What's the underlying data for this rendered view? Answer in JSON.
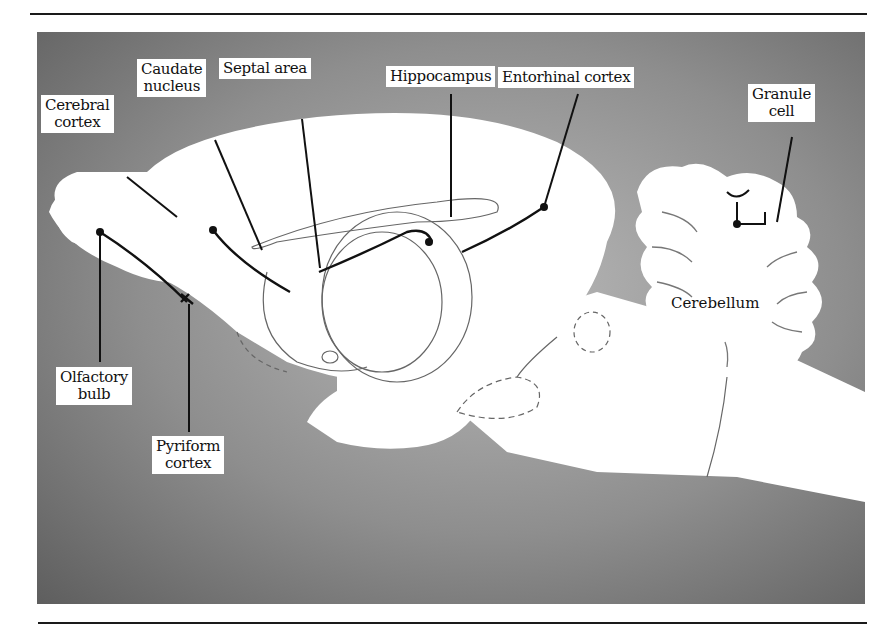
{
  "figure": {
    "type": "sagittal brain diagram",
    "colors": {
      "background_noise": "#8e8e8e",
      "tissue": "#ffffff",
      "lines": "#111111",
      "rule": "#1a1a1a"
    }
  },
  "labels": {
    "cerebral_cortex": {
      "line1": "Cerebral",
      "line2": "cortex"
    },
    "caudate_nucleus": {
      "line1": "Caudate",
      "line2": "nucleus"
    },
    "septal_area": {
      "line1": "Septal area"
    },
    "hippocampus": {
      "line1": "Hippocampus"
    },
    "entorhinal_cortex": {
      "line1": "Entorhinal cortex"
    },
    "granule_cell": {
      "line1": "Granule",
      "line2": "cell"
    },
    "olfactory_bulb": {
      "line1": "Olfactory",
      "line2": "bulb"
    },
    "pyriform_cortex": {
      "line1": "Pyriform",
      "line2": "cortex"
    },
    "cerebellum": {
      "line1": "Cerebellum"
    }
  }
}
